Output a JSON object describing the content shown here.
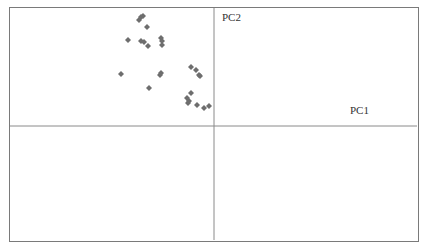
{
  "chart_data": {
    "type": "scatter",
    "title": "",
    "xlabel": "PC1",
    "ylabel": "PC2",
    "grid": false,
    "legend": null,
    "marker": {
      "shape": "diamond",
      "color": "#6e6e6e"
    },
    "axis_origin_px": [
      214,
      126
    ],
    "points": [
      {
        "x": -75,
        "y": 106
      },
      {
        "x": -73,
        "y": 109
      },
      {
        "x": -71,
        "y": 110
      },
      {
        "x": -67,
        "y": 99
      },
      {
        "x": -86,
        "y": 86
      },
      {
        "x": -73,
        "y": 85
      },
      {
        "x": -70,
        "y": 84
      },
      {
        "x": -66,
        "y": 80
      },
      {
        "x": -53,
        "y": 88
      },
      {
        "x": -52,
        "y": 85
      },
      {
        "x": -52,
        "y": 81
      },
      {
        "x": -93,
        "y": 52
      },
      {
        "x": -53,
        "y": 53
      },
      {
        "x": -54,
        "y": 51
      },
      {
        "x": -65,
        "y": 38
      },
      {
        "x": -23,
        "y": 59
      },
      {
        "x": -18,
        "y": 56
      },
      {
        "x": -15,
        "y": 51
      },
      {
        "x": -14,
        "y": 50
      },
      {
        "x": -23,
        "y": 33
      },
      {
        "x": -27,
        "y": 28
      },
      {
        "x": -25,
        "y": 25
      },
      {
        "x": -26,
        "y": 23
      },
      {
        "x": -17,
        "y": 21
      },
      {
        "x": -10,
        "y": 18
      },
      {
        "x": -5,
        "y": 20
      }
    ]
  },
  "labels": {
    "x_axis": "PC1",
    "y_axis": "PC2"
  },
  "colors": {
    "frame": "#7a7a7a",
    "axes": "#8a8a8a",
    "marker": "#6e6e6e"
  }
}
